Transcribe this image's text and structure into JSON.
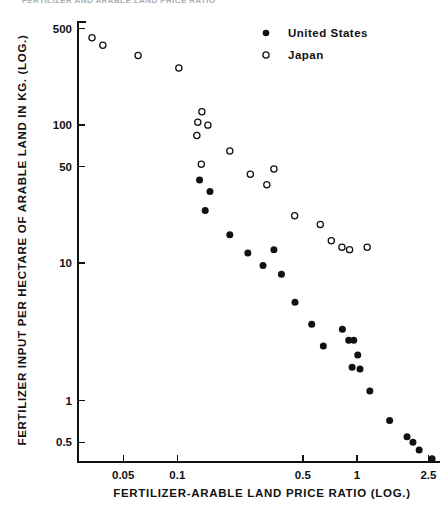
{
  "figure": {
    "top_caption": "FERTILIZER AND ARABLE LAND PRICE RATIO",
    "background_color": "#ffffff",
    "ink_color": "#111111"
  },
  "chart_data": {
    "type": "scatter",
    "title": "",
    "xlabel": "FERTILIZER-ARABLE LAND PRICE RATIO (LOG.)",
    "ylabel": "FERTILIZER INPUT PER HECTARE OF ARABLE LAND IN KG. (LOG.)",
    "xscale": "log",
    "yscale": "log",
    "xlim": [
      0.028,
      2.9
    ],
    "ylim": [
      0.36,
      560
    ],
    "grid": false,
    "legend_position": "top-right",
    "xticks": [
      0.05,
      0.1,
      0.5,
      1,
      2.5
    ],
    "xtick_labels": [
      "0.05",
      "0.1",
      "0.5",
      "1",
      "2.5"
    ],
    "yticks": [
      0.5,
      1,
      10,
      50,
      100,
      500
    ],
    "ytick_labels": [
      "0.5",
      "1",
      "10",
      "50",
      "100",
      "500"
    ],
    "series": [
      {
        "name": "United States",
        "marker": "filled-circle",
        "color": "#111111",
        "points": [
          [
            0.133,
            40.0
          ],
          [
            0.152,
            33.0
          ],
          [
            0.143,
            24.0
          ],
          [
            0.196,
            16.0
          ],
          [
            0.247,
            11.8
          ],
          [
            0.3,
            9.6
          ],
          [
            0.38,
            8.3
          ],
          [
            0.345,
            12.5
          ],
          [
            0.452,
            5.2
          ],
          [
            0.56,
            3.6
          ],
          [
            0.65,
            2.5
          ],
          [
            0.83,
            3.3
          ],
          [
            0.9,
            2.75
          ],
          [
            0.96,
            2.75
          ],
          [
            1.01,
            2.15
          ],
          [
            0.94,
            1.75
          ],
          [
            1.04,
            1.7
          ],
          [
            1.18,
            1.18
          ],
          [
            1.52,
            0.72
          ],
          [
            1.9,
            0.55
          ],
          [
            2.05,
            0.5
          ],
          [
            2.22,
            0.44
          ],
          [
            2.62,
            0.38
          ]
        ]
      },
      {
        "name": "Japan",
        "marker": "open-circle",
        "color": "#111111",
        "points": [
          [
            0.0335,
            430.0
          ],
          [
            0.0385,
            380.0
          ],
          [
            0.0605,
            320.0
          ],
          [
            0.102,
            260.0
          ],
          [
            0.137,
            125.0
          ],
          [
            0.13,
            105.0
          ],
          [
            0.148,
            100.0
          ],
          [
            0.1285,
            84.0
          ],
          [
            0.196,
            65.0
          ],
          [
            0.136,
            52.0
          ],
          [
            0.255,
            44.0
          ],
          [
            0.345,
            48.0
          ],
          [
            0.315,
            37.0
          ],
          [
            0.45,
            22.0
          ],
          [
            0.625,
            19.0
          ],
          [
            0.72,
            14.5
          ],
          [
            0.825,
            13.0
          ],
          [
            0.91,
            12.5
          ],
          [
            1.14,
            13.0
          ]
        ]
      }
    ]
  },
  "legend": {
    "entries": [
      {
        "label": "United States",
        "marker": "filled-circle"
      },
      {
        "label": "Japan",
        "marker": "open-circle"
      }
    ]
  }
}
